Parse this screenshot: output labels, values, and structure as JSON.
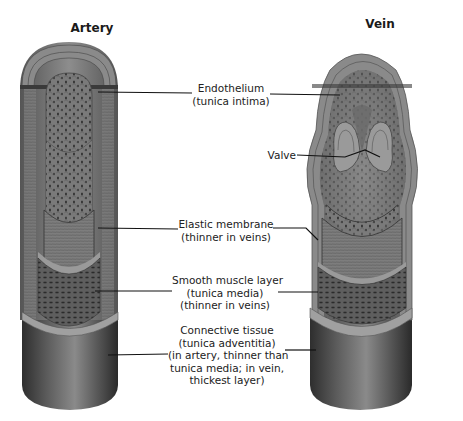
{
  "diagram": {
    "titles": {
      "artery": "Artery",
      "vein": "Vein"
    },
    "labels": [
      {
        "id": "endothelium",
        "lines": [
          "Endothelium",
          "(tunica intima)"
        ]
      },
      {
        "id": "valve",
        "lines": [
          "Valve"
        ]
      },
      {
        "id": "elastic-membrane",
        "lines": [
          "Elastic membrane",
          "(thinner in veins)"
        ]
      },
      {
        "id": "smooth-muscle",
        "lines": [
          "Smooth muscle layer",
          "(tunica media)",
          "(thinner in veins)"
        ]
      },
      {
        "id": "connective-tissue",
        "lines": [
          "Connective tissue",
          "(tunica adventitia)",
          "(in artery, thinner than",
          "tunica media; in vein,",
          "thickest layer)"
        ]
      }
    ],
    "colors": {
      "outer_wall": "#6e6e6e",
      "inner_lumen": "#7a7a7a",
      "dark_shade": "#3a3a3a",
      "light_band": "#a8a8a8"
    }
  }
}
